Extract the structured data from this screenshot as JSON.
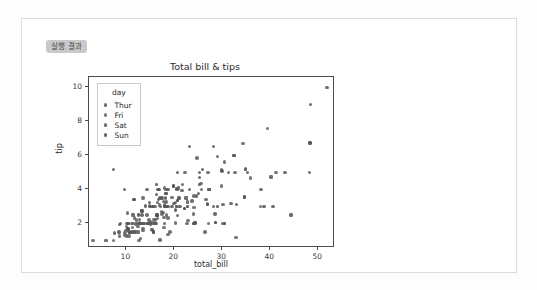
{
  "badge": {
    "label": "실행 결과"
  },
  "chart_data": {
    "type": "scatter",
    "title": "Total bill & tips",
    "xlabel": "total_bill",
    "ylabel": "tip",
    "xlim": [
      2.2,
      53.5
    ],
    "ylim": [
      0.55,
      10.6
    ],
    "xticks": [
      10,
      20,
      30,
      40,
      50
    ],
    "yticks": [
      2,
      4,
      6,
      8,
      10
    ],
    "grid": false,
    "legend": {
      "title": "day",
      "position": "upper left",
      "entries": [
        {
          "label": "Thur",
          "color": "#5d5d5d"
        },
        {
          "label": "Fri",
          "color": "#6e6e6e"
        },
        {
          "label": "Sat",
          "color": "#5d5d5d"
        },
        {
          "label": "Sun",
          "color": "#555555"
        }
      ]
    },
    "marker_color": "#5d5d5d",
    "marker_size": 3.4,
    "series": [
      {
        "name": "Thur",
        "color": "#5d5d5d",
        "points": [
          [
            27.2,
            4.0
          ],
          [
            22.76,
            3.0
          ],
          [
            17.29,
            2.71
          ],
          [
            19.44,
            3.0
          ],
          [
            16.66,
            3.4
          ],
          [
            10.07,
            1.83
          ],
          [
            32.68,
            5.0
          ],
          [
            15.98,
            2.03
          ],
          [
            34.83,
            5.17
          ],
          [
            13.03,
            2.0
          ],
          [
            18.28,
            4.0
          ],
          [
            24.71,
            5.85
          ],
          [
            21.16,
            3.0
          ],
          [
            28.97,
            3.0
          ],
          [
            22.49,
            3.5
          ],
          [
            5.75,
            1.0
          ],
          [
            16.32,
            4.3
          ],
          [
            22.75,
            3.25
          ],
          [
            40.17,
            4.73
          ],
          [
            27.28,
            4.0
          ],
          [
            12.03,
            1.5
          ],
          [
            21.01,
            3.0
          ],
          [
            12.46,
            1.5
          ],
          [
            11.35,
            2.5
          ],
          [
            15.38,
            3.0
          ],
          [
            44.3,
            2.5
          ],
          [
            22.42,
            3.48
          ],
          [
            20.92,
            4.08
          ],
          [
            15.36,
            1.64
          ],
          [
            20.49,
            4.06
          ],
          [
            25.21,
            4.29
          ],
          [
            18.24,
            3.76
          ],
          [
            14.31,
            4.0
          ],
          [
            14.0,
            3.0
          ],
          [
            7.25,
            1.0
          ],
          [
            38.07,
            4.0
          ],
          [
            23.95,
            2.55
          ],
          [
            25.71,
            4.0
          ],
          [
            17.31,
            3.5
          ],
          [
            29.93,
            5.07
          ],
          [
            10.65,
            1.5
          ],
          [
            12.43,
            1.8
          ],
          [
            24.08,
            2.92
          ],
          [
            11.69,
            2.31
          ],
          [
            13.42,
            1.68
          ],
          [
            14.26,
            2.5
          ],
          [
            15.95,
            2.0
          ],
          [
            12.48,
            2.52
          ],
          [
            29.8,
            4.2
          ],
          [
            8.52,
            1.48
          ],
          [
            14.52,
            2.0
          ],
          [
            11.38,
            2.0
          ],
          [
            22.82,
            2.18
          ],
          [
            19.08,
            1.5
          ],
          [
            20.27,
            2.83
          ],
          [
            11.17,
            1.5
          ],
          [
            12.26,
            2.0
          ],
          [
            18.26,
            3.25
          ],
          [
            8.51,
            1.25
          ],
          [
            10.33,
            2.0
          ],
          [
            14.15,
            2.0
          ],
          [
            16.0,
            2.0
          ],
          [
            13.16,
            2.75
          ],
          [
            17.47,
            3.5
          ],
          [
            34.3,
            6.7
          ],
          [
            41.19,
            5.0
          ],
          [
            27.05,
            5.0
          ],
          [
            16.43,
            2.3
          ],
          [
            8.35,
            1.5
          ],
          [
            18.64,
            1.36
          ]
        ]
      },
      {
        "name": "Fri",
        "color": "#6e6e6e",
        "points": [
          [
            28.97,
            3.0
          ],
          [
            22.49,
            3.5
          ],
          [
            5.75,
            1.0
          ],
          [
            16.32,
            4.3
          ],
          [
            22.75,
            3.25
          ],
          [
            40.17,
            4.73
          ],
          [
            27.28,
            4.0
          ],
          [
            12.03,
            1.5
          ],
          [
            21.01,
            3.0
          ],
          [
            12.46,
            1.5
          ],
          [
            11.35,
            2.5
          ],
          [
            15.38,
            3.0
          ],
          [
            44.3,
            2.5
          ],
          [
            22.42,
            3.48
          ],
          [
            20.92,
            4.08
          ],
          [
            15.36,
            1.64
          ],
          [
            20.49,
            4.06
          ],
          [
            25.21,
            4.29
          ],
          [
            18.24,
            3.76
          ]
        ]
      },
      {
        "name": "Sat",
        "color": "#5d5d5d",
        "points": [
          [
            20.65,
            3.35
          ],
          [
            17.92,
            4.08
          ],
          [
            20.29,
            2.75
          ],
          [
            15.77,
            2.23
          ],
          [
            39.42,
            7.58
          ],
          [
            19.82,
            3.18
          ],
          [
            17.81,
            2.34
          ],
          [
            13.37,
            2.0
          ],
          [
            12.69,
            2.0
          ],
          [
            21.7,
            4.3
          ],
          [
            19.65,
            3.0
          ],
          [
            9.55,
            1.45
          ],
          [
            18.35,
            2.5
          ],
          [
            15.06,
            3.0
          ],
          [
            20.69,
            2.45
          ],
          [
            17.78,
            3.27
          ],
          [
            24.06,
            3.6
          ],
          [
            16.31,
            2.0
          ],
          [
            16.93,
            3.07
          ],
          [
            18.69,
            2.31
          ],
          [
            31.27,
            5.0
          ],
          [
            16.04,
            2.24
          ],
          [
            17.46,
            2.54
          ],
          [
            13.94,
            3.06
          ],
          [
            9.68,
            1.32
          ],
          [
            30.4,
            5.6
          ],
          [
            18.29,
            3.0
          ],
          [
            22.23,
            5.0
          ],
          [
            32.4,
            6.0
          ],
          [
            28.55,
            2.05
          ],
          [
            18.04,
            3.0
          ],
          [
            12.54,
            2.5
          ],
          [
            10.29,
            2.6
          ],
          [
            34.81,
            5.2
          ],
          [
            9.94,
            1.56
          ],
          [
            25.56,
            4.34
          ],
          [
            19.49,
            3.51
          ],
          [
            38.01,
            3.0
          ],
          [
            26.41,
            1.5
          ],
          [
            11.24,
            1.76
          ],
          [
            48.27,
            6.73
          ],
          [
            20.29,
            3.21
          ],
          [
            13.81,
            2.0
          ],
          [
            11.02,
            1.98
          ],
          [
            18.29,
            3.76
          ],
          [
            17.59,
            2.64
          ],
          [
            20.08,
            3.15
          ],
          [
            16.45,
            2.47
          ],
          [
            3.07,
            1.0
          ],
          [
            20.23,
            2.01
          ],
          [
            15.01,
            2.09
          ],
          [
            12.02,
            1.97
          ],
          [
            17.07,
            3.0
          ],
          [
            26.86,
            3.14
          ],
          [
            25.28,
            5.0
          ],
          [
            14.73,
            2.2
          ],
          [
            10.51,
            1.25
          ],
          [
            17.92,
            3.08
          ],
          [
            27.2,
            4.0
          ],
          [
            22.76,
            3.0
          ],
          [
            30.14,
            3.09
          ],
          [
            12.16,
            2.2
          ],
          [
            13.42,
            3.48
          ],
          [
            8.58,
            1.92
          ],
          [
            15.98,
            3.0
          ],
          [
            13.42,
            1.58
          ],
          [
            16.27,
            2.5
          ],
          [
            10.09,
            2.0
          ],
          [
            20.45,
            3.0
          ],
          [
            13.28,
            2.72
          ],
          [
            22.12,
            2.88
          ],
          [
            24.01,
            2.0
          ],
          [
            15.69,
            3.0
          ],
          [
            11.61,
            3.39
          ],
          [
            10.77,
            1.47
          ],
          [
            15.53,
            3.0
          ],
          [
            10.07,
            1.25
          ],
          [
            12.6,
            1.0
          ],
          [
            32.83,
            1.17
          ],
          [
            35.83,
            4.67
          ],
          [
            29.03,
            5.92
          ],
          [
            27.18,
            2.0
          ],
          [
            22.67,
            2.0
          ],
          [
            17.82,
            1.75
          ],
          [
            18.78,
            3.0
          ]
        ]
      },
      {
        "name": "Sun",
        "color": "#555555",
        "points": [
          [
            16.99,
            1.01
          ],
          [
            10.34,
            1.66
          ],
          [
            21.01,
            3.5
          ],
          [
            23.68,
            3.31
          ],
          [
            24.59,
            3.61
          ],
          [
            25.29,
            4.71
          ],
          [
            8.77,
            2.0
          ],
          [
            26.88,
            3.12
          ],
          [
            15.04,
            1.96
          ],
          [
            14.78,
            3.23
          ],
          [
            10.27,
            1.71
          ],
          [
            35.26,
            5.0
          ],
          [
            15.42,
            1.57
          ],
          [
            18.43,
            3.0
          ],
          [
            14.83,
            3.02
          ],
          [
            21.58,
            3.92
          ],
          [
            10.33,
            1.67
          ],
          [
            16.29,
            3.71
          ],
          [
            16.97,
            3.5
          ],
          [
            20.65,
            3.35
          ],
          [
            16.4,
            2.5
          ],
          [
            32.4,
            6.0
          ],
          [
            28.55,
            2.05
          ],
          [
            13.0,
            2.0
          ],
          [
            30.46,
            2.0
          ],
          [
            34.63,
            3.55
          ],
          [
            51.87,
            10.0
          ],
          [
            18.04,
            3.0
          ],
          [
            19.81,
            4.19
          ],
          [
            24.27,
            2.03
          ],
          [
            48.17,
            5.0
          ],
          [
            29.85,
            5.14
          ],
          [
            25.0,
            3.75
          ],
          [
            48.33,
            9.0
          ],
          [
            13.27,
            2.5
          ],
          [
            28.17,
            6.5
          ],
          [
            12.9,
            1.1
          ],
          [
            28.15,
            3.0
          ],
          [
            11.59,
            1.5
          ],
          [
            7.25,
            5.15
          ],
          [
            31.85,
            3.18
          ],
          [
            16.82,
            4.0
          ],
          [
            32.9,
            3.11
          ],
          [
            17.89,
            2.0
          ],
          [
            14.48,
            2.0
          ],
          [
            9.6,
            4.0
          ],
          [
            34.63,
            3.55
          ],
          [
            23.17,
            6.5
          ],
          [
            40.55,
            3.0
          ],
          [
            20.69,
            5.0
          ],
          [
            20.9,
            3.5
          ],
          [
            30.46,
            2.0
          ],
          [
            18.15,
            3.5
          ],
          [
            23.1,
            4.0
          ],
          [
            15.69,
            1.5
          ],
          [
            19.81,
            4.19
          ],
          [
            28.44,
            2.56
          ],
          [
            15.48,
            2.02
          ],
          [
            16.58,
            4.0
          ],
          [
            7.56,
            1.44
          ],
          [
            10.34,
            2.0
          ],
          [
            43.11,
            5.0
          ],
          [
            13.0,
            2.0
          ],
          [
            13.51,
            2.0
          ],
          [
            18.71,
            4.0
          ],
          [
            12.74,
            2.01
          ],
          [
            13.0,
            2.0
          ],
          [
            16.4,
            2.5
          ],
          [
            20.53,
            4.0
          ],
          [
            16.47,
            3.23
          ],
          [
            26.59,
            3.41
          ],
          [
            38.73,
            3.0
          ],
          [
            24.27,
            2.03
          ],
          [
            12.76,
            2.23
          ],
          [
            30.06,
            2.0
          ],
          [
            25.89,
            5.16
          ],
          [
            48.27,
            6.73
          ],
          [
            20.45,
            3.0
          ],
          [
            13.28,
            2.72
          ],
          [
            22.12,
            2.88
          ],
          [
            24.01,
            2.0
          ],
          [
            15.69,
            1.5
          ],
          [
            11.61,
            3.39
          ],
          [
            10.77,
            1.47
          ]
        ]
      }
    ]
  }
}
